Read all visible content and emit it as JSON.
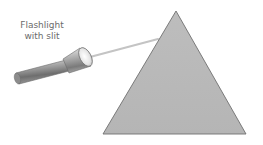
{
  "diagram": {
    "label": {
      "line1": "Flashlight",
      "line2": "with slit"
    },
    "objects": {
      "flashlight": "flashlight-with-slit",
      "beam": "light-beam",
      "prism": "triangular-prism"
    },
    "colors": {
      "prism_fill": "#b9b9b9",
      "prism_stroke": "#6f6f6f",
      "beam": "#c4c4c4",
      "label": "#6b6b6b"
    }
  }
}
